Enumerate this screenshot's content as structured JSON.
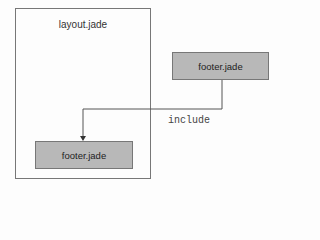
{
  "diagram": {
    "container": {
      "label": "layout.jade"
    },
    "source_node": {
      "label": "footer.jade"
    },
    "target_node": {
      "label": "footer.jade"
    },
    "edge": {
      "label": "include",
      "from": "source_node",
      "to": "target_node"
    },
    "colors": {
      "node_fill": "#b8b8b8",
      "border": "#777777",
      "background": "#fdfdfd"
    }
  }
}
